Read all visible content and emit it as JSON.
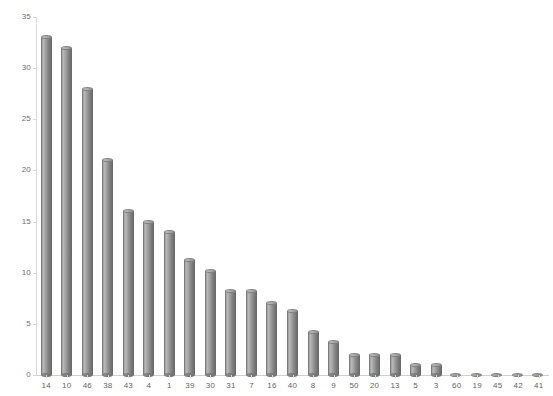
{
  "chart_data": {
    "type": "bar",
    "title": "",
    "subtitle": "",
    "xlabel": "",
    "ylabel": "",
    "categories": [
      "14",
      "10",
      "46",
      "38",
      "43",
      "4",
      "1",
      "39",
      "30",
      "31",
      "7",
      "16",
      "40",
      "8",
      "9",
      "50",
      "20",
      "13",
      "5",
      "3",
      "60",
      "19",
      "45",
      "42",
      "41"
    ],
    "values": [
      33,
      32,
      28,
      21,
      16,
      15,
      14,
      11.2,
      10.2,
      8.2,
      8.2,
      7,
      6.3,
      4.2,
      3.2,
      2,
      2,
      2,
      1,
      1,
      0,
      0,
      0,
      0,
      0
    ],
    "series": [
      {
        "name": "count",
        "values": [
          33,
          32,
          28,
          21,
          16,
          15,
          14,
          11.2,
          10.2,
          8.2,
          8.2,
          7,
          6.3,
          4.2,
          3.2,
          2,
          2,
          2,
          1,
          1,
          0,
          0,
          0,
          0,
          0
        ]
      }
    ],
    "ylim": [
      0,
      35
    ],
    "y_ticks": [
      "0",
      "5",
      "10",
      "15",
      "20",
      "25",
      "30",
      "35"
    ],
    "y_tick_values": [
      0,
      5,
      10,
      15,
      20,
      25,
      30,
      35
    ],
    "grid": false,
    "legend": null,
    "legend_position": "none",
    "bar_style": "cylinder-3d",
    "colors": {
      "bar_light": "#b9b9b9",
      "bar_mid": "#8b8b8b",
      "bar_dark": "#6d6d6d",
      "axis": "#d9d9d9",
      "tick_text": "#5f5f5f",
      "background": "#ffffff"
    }
  }
}
